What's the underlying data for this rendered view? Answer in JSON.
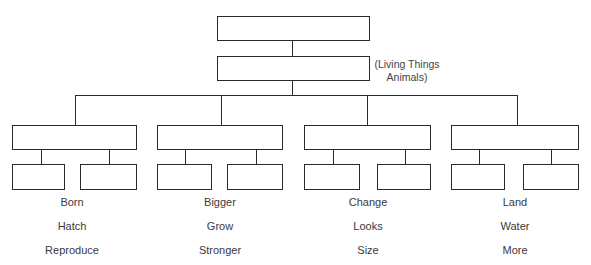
{
  "diagram": {
    "type": "hierarchy-organizer",
    "root": {
      "label": ""
    },
    "level2": {
      "label": "",
      "note_line1": "(Living Things",
      "note_line2": "Animals)"
    },
    "branches": [
      {
        "label": "",
        "children": [
          "",
          ""
        ],
        "words": [
          "Born",
          "Hatch",
          "Reproduce"
        ]
      },
      {
        "label": "",
        "children": [
          "",
          ""
        ],
        "words": [
          "Bigger",
          "Grow",
          "Stronger"
        ]
      },
      {
        "label": "",
        "children": [
          "",
          ""
        ],
        "words": [
          "Change",
          "Looks",
          "Size"
        ]
      },
      {
        "label": "",
        "children": [
          "",
          ""
        ],
        "words": [
          "Land",
          "Water",
          "More"
        ]
      }
    ]
  }
}
